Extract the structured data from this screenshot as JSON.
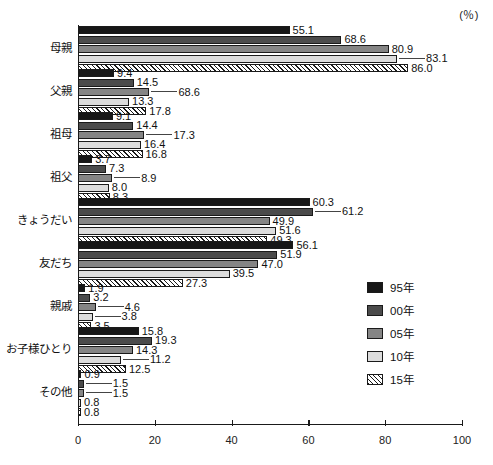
{
  "unit_label": "(％)",
  "legend": {
    "position": "right-middle",
    "entries": [
      {
        "label": "95年",
        "swatch": "solid-black",
        "color": "#171717"
      },
      {
        "label": "00年",
        "swatch": "solid-darkgray",
        "color": "#4b4b4b"
      },
      {
        "label": "05年",
        "swatch": "solid-midgray",
        "color": "#858585"
      },
      {
        "label": "10年",
        "swatch": "solid-lightgray",
        "color": "#dcdcdc"
      },
      {
        "label": "15年",
        "swatch": "diagonal-hatch",
        "color": "#ffffff"
      }
    ]
  },
  "chart_data": {
    "type": "bar",
    "orientation": "horizontal",
    "title": "",
    "xlabel": "",
    "ylabel": "",
    "unit": "％",
    "xlim": [
      0,
      100
    ],
    "xticks": [
      0,
      20,
      40,
      60,
      80,
      100
    ],
    "grid": false,
    "categories": [
      "母親",
      "父親",
      "祖母",
      "祖父",
      "きょうだい",
      "友だち",
      "親戚",
      "お子様ひとり",
      "その他"
    ],
    "series": [
      {
        "name": "95年",
        "values": [
          55.1,
          9.4,
          9.1,
          3.7,
          60.3,
          56.1,
          1.9,
          15.8,
          0.9
        ]
      },
      {
        "name": "00年",
        "values": [
          68.6,
          14.5,
          14.4,
          7.3,
          61.2,
          51.9,
          3.2,
          19.3,
          1.5
        ]
      },
      {
        "name": "05年",
        "values": [
          80.9,
          68.6,
          17.3,
          8.9,
          49.9,
          47.0,
          4.6,
          14.3,
          1.5
        ]
      },
      {
        "name": "10年",
        "values": [
          83.1,
          13.3,
          16.4,
          8.0,
          51.6,
          39.5,
          3.8,
          11.2,
          0.8
        ]
      },
      {
        "name": "15年",
        "values": [
          86.0,
          17.8,
          16.8,
          8.3,
          49.3,
          27.3,
          3.5,
          12.5,
          0.8
        ]
      }
    ],
    "bar_lengths": [
      [
        55.1,
        9.4,
        9.1,
        3.7,
        60.3,
        56.1,
        1.9,
        15.8,
        0.9
      ],
      [
        68.6,
        14.5,
        14.4,
        7.3,
        61.2,
        51.9,
        3.2,
        19.3,
        1.5
      ],
      [
        80.9,
        18.6,
        17.3,
        8.9,
        49.9,
        47.0,
        4.6,
        14.3,
        1.5
      ],
      [
        83.1,
        13.3,
        16.4,
        8.0,
        51.6,
        39.5,
        3.8,
        11.2,
        0.8
      ],
      [
        86.0,
        17.8,
        16.8,
        8.3,
        49.3,
        27.3,
        3.5,
        12.5,
        0.8
      ]
    ],
    "leader_line_labels": [
      {
        "category": "母親",
        "series": "10年",
        "value": 83.1
      },
      {
        "category": "父親",
        "series": "05年",
        "value": 68.6
      },
      {
        "category": "祖母",
        "series": "05年",
        "value": 17.3
      },
      {
        "category": "祖父",
        "series": "05年",
        "value": 8.9
      },
      {
        "category": "きょうだい",
        "series": "00年",
        "value": 61.2
      },
      {
        "category": "親戚",
        "series": "05年",
        "value": 4.6
      },
      {
        "category": "親戚",
        "series": "10年",
        "value": 3.8
      },
      {
        "category": "お子様ひとり",
        "series": "10年",
        "value": 11.2
      },
      {
        "category": "その他",
        "series": "00年",
        "value": 1.5
      },
      {
        "category": "その他",
        "series": "05年",
        "value": 1.5
      }
    ]
  }
}
